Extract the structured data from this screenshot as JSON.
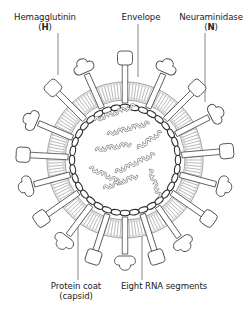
{
  "diagram": {
    "colors": {
      "stroke": "#4a4a4a",
      "light_stroke": "#8a8a8a",
      "leader": "#555555",
      "text": "#222222",
      "background": "#ffffff"
    },
    "center": [
      125,
      160
    ],
    "labels": {
      "hemagglutinin": {
        "line1": "Hemagglutinin",
        "open": "(",
        "letter": "H",
        "close": ")"
      },
      "envelope": {
        "line1": "Envelope"
      },
      "neuraminidase": {
        "line1": "Neuraminidase",
        "open": "(",
        "letter": "N",
        "close": ")"
      },
      "protein_coat": {
        "line1": "Protein coat",
        "line2": "(capsid)"
      },
      "rna": {
        "line1": "Eight RNA segments"
      }
    },
    "leaders": [
      {
        "name": "hemagglutinin-leader",
        "x1": 58,
        "y1": 33,
        "x2": 58,
        "y2": 75
      },
      {
        "name": "envelope-leader",
        "x1": 138,
        "y1": 24,
        "x2": 138,
        "y2": 77
      },
      {
        "name": "neuraminidase-leader",
        "x1": 205,
        "y1": 33,
        "x2": 205,
        "y2": 102
      },
      {
        "name": "protein-coat-leader",
        "x1": 78,
        "y1": 203,
        "x2": 78,
        "y2": 280
      },
      {
        "name": "rna-leader",
        "x1": 142,
        "y1": 200,
        "x2": 142,
        "y2": 280
      }
    ],
    "spikes": [
      {
        "angle": -90,
        "type": "H"
      },
      {
        "angle": -66,
        "type": "N"
      },
      {
        "angle": -45,
        "type": "H"
      },
      {
        "angle": -27,
        "type": "N"
      },
      {
        "angle": -5,
        "type": "H"
      },
      {
        "angle": 15,
        "type": "N"
      },
      {
        "angle": 35,
        "type": "H"
      },
      {
        "angle": 55,
        "type": "N"
      },
      {
        "angle": 72,
        "type": "H"
      },
      {
        "angle": 90,
        "type": "N"
      },
      {
        "angle": 108,
        "type": "H"
      },
      {
        "angle": 127,
        "type": "N"
      },
      {
        "angle": 145,
        "type": "H"
      },
      {
        "angle": 165,
        "type": "N"
      },
      {
        "angle": 183,
        "type": "H"
      },
      {
        "angle": 203,
        "type": "N"
      },
      {
        "angle": 225,
        "type": "H"
      },
      {
        "angle": 246,
        "type": "N"
      }
    ],
    "membrane": {
      "outer_radius": 78,
      "inner_radius": 60,
      "lipid_count": 150
    },
    "capsid": {
      "radius": 53,
      "bead_count": 36
    },
    "rna_segments": [
      {
        "x": 95,
        "y": 120,
        "len": 42,
        "rot": -20
      },
      {
        "x": 108,
        "y": 134,
        "len": 44,
        "rot": -15
      },
      {
        "x": 96,
        "y": 150,
        "len": 38,
        "rot": -10
      },
      {
        "x": 138,
        "y": 148,
        "len": 30,
        "rot": -35
      },
      {
        "x": 90,
        "y": 168,
        "len": 34,
        "rot": 25
      },
      {
        "x": 116,
        "y": 172,
        "len": 40,
        "rot": -25
      },
      {
        "x": 104,
        "y": 188,
        "len": 38,
        "rot": -20
      },
      {
        "x": 150,
        "y": 170,
        "len": 26,
        "rot": 70
      }
    ]
  }
}
